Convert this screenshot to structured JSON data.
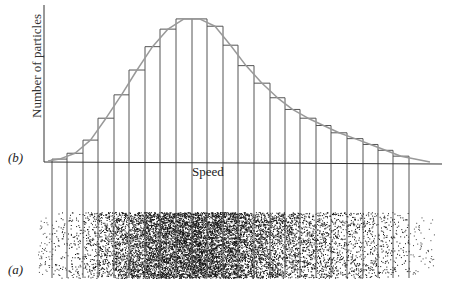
{
  "labels": {
    "panel_b": "(b)",
    "panel_a": "(a)",
    "y_axis": "Number of particles",
    "x_axis": "Speed"
  },
  "chart_data": {
    "type": "bar",
    "title": "",
    "xlabel": "Speed",
    "ylabel": "Number of particles",
    "bin_edges_px": [
      52,
      67,
      83,
      98,
      114,
      129,
      145,
      160,
      176,
      192,
      207,
      223,
      238,
      254,
      270,
      285,
      300,
      316,
      331,
      347,
      363,
      378,
      393,
      409
    ],
    "categories": [
      "1",
      "2",
      "3",
      "4",
      "5",
      "6",
      "7",
      "8",
      "9",
      "10",
      "11",
      "12",
      "13",
      "14",
      "15",
      "16",
      "17",
      "18",
      "19",
      "20",
      "21",
      "22",
      "23"
    ],
    "values": [
      2,
      6,
      15,
      30,
      46,
      63,
      79,
      91,
      98,
      98,
      93,
      80,
      66,
      54,
      44,
      36,
      30,
      25,
      20,
      16,
      12,
      8,
      4
    ],
    "ylim": [
      0,
      100
    ],
    "grid": false,
    "legend": false
  },
  "colors": {
    "bar_stroke": "#555555",
    "curve": "#999999",
    "axis": "#333333",
    "dots": "#111111"
  }
}
